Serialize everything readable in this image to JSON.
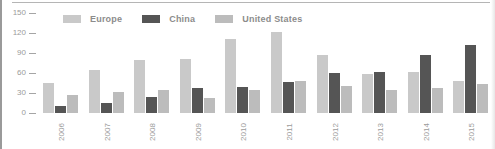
{
  "chart_data": {
    "type": "bar",
    "title": "",
    "xlabel": "",
    "ylabel": "",
    "ylim": [
      0,
      150
    ],
    "yticks": [
      150,
      120,
      90,
      60,
      30,
      0
    ],
    "grid": false,
    "legend_position": "top",
    "categories": [
      "2006",
      "2007",
      "2008",
      "2009",
      "2010",
      "2011",
      "2012",
      "2013",
      "2014",
      "2015"
    ],
    "series": [
      {
        "name": "Europe",
        "color": "#c9c9c9",
        "values": [
          45,
          64,
          80,
          81,
          111,
          121,
          87,
          59,
          61,
          48
        ]
      },
      {
        "name": "China",
        "color": "#555555",
        "values": [
          10,
          15,
          24,
          38,
          39,
          47,
          60,
          61,
          87,
          102
        ]
      },
      {
        "name": "United States",
        "color": "#bcbcbc",
        "values": [
          27,
          32,
          35,
          23,
          34,
          48,
          40,
          35,
          37,
          43
        ]
      }
    ]
  },
  "legend": {
    "items": [
      {
        "label": "Europe",
        "color": "#c9c9c9"
      },
      {
        "label": "China",
        "color": "#555555"
      },
      {
        "label": "United States",
        "color": "#bcbcbc"
      }
    ]
  },
  "yaxis": {
    "ticks": [
      "150",
      "120",
      "90",
      "60",
      "30",
      "0"
    ]
  }
}
